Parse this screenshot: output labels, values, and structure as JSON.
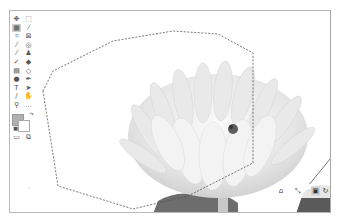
{
  "app": {
    "title": "Image editor canvas"
  },
  "toolbar": {
    "tools": [
      {
        "name": "move-tool",
        "glyph": "✥",
        "col": 0,
        "row": 0
      },
      {
        "name": "rect-marquee-tool",
        "glyph": "⬚",
        "col": 1,
        "row": 0
      },
      {
        "name": "object-select-tool",
        "glyph": "▦",
        "col": 0,
        "row": 1,
        "active": true
      },
      {
        "name": "magic-wand-tool",
        "glyph": "⁄",
        "col": 1,
        "row": 1
      },
      {
        "name": "crop-tool",
        "glyph": "⌗",
        "col": 0,
        "row": 2
      },
      {
        "name": "frame-tool",
        "glyph": "⊠",
        "col": 1,
        "row": 2
      },
      {
        "name": "eyedropper-tool",
        "glyph": "⁄",
        "col": 0,
        "row": 3
      },
      {
        "name": "spot-heal-tool",
        "glyph": "◎",
        "col": 1,
        "row": 3
      },
      {
        "name": "brush-tool",
        "glyph": "⁄",
        "col": 0,
        "row": 4
      },
      {
        "name": "stamp-tool",
        "glyph": "♟",
        "col": 1,
        "row": 4
      },
      {
        "name": "history-brush-tool",
        "glyph": "✓",
        "col": 0,
        "row": 5
      },
      {
        "name": "eraser-tool",
        "glyph": "◆",
        "col": 1,
        "row": 5
      },
      {
        "name": "gradient-tool",
        "glyph": "▤",
        "col": 0,
        "row": 6
      },
      {
        "name": "blur-tool",
        "glyph": "◇",
        "col": 1,
        "row": 6
      },
      {
        "name": "dodge-tool",
        "glyph": "●",
        "col": 0,
        "row": 7
      },
      {
        "name": "pen-tool",
        "glyph": "✒",
        "col": 1,
        "row": 7
      },
      {
        "name": "type-tool",
        "glyph": "T",
        "col": 0,
        "row": 8
      },
      {
        "name": "path-select-tool",
        "glyph": "➤",
        "col": 1,
        "row": 8
      },
      {
        "name": "line-tool",
        "glyph": "∕",
        "col": 0,
        "row": 9
      },
      {
        "name": "hand-tool",
        "glyph": "✋",
        "col": 1,
        "row": 9
      },
      {
        "name": "zoom-tool",
        "glyph": "⚲",
        "col": 0,
        "row": 10
      },
      {
        "name": "more-tools",
        "glyph": "…",
        "col": 1,
        "row": 10
      }
    ],
    "bottom": [
      {
        "name": "quick-mask-button",
        "glyph": "▭",
        "col": 0
      },
      {
        "name": "screen-mode-button",
        "glyph": "⧉",
        "col": 1
      }
    ],
    "colors": {
      "foreground": "#b0b0b0",
      "background": "#ffffff"
    }
  },
  "canvas": {
    "selection": "polygonal lasso (marching ants)",
    "image": "white chrysanthemum flower, grayscale"
  },
  "nav_panel": {
    "home": "⌂",
    "transform": "⤡",
    "separator": "·",
    "buttons": [
      {
        "name": "select-mode-rect",
        "glyph": "▣",
        "selected": true
      },
      {
        "name": "select-mode-lasso",
        "glyph": "↻",
        "selected": false
      },
      {
        "name": "select-mode-poly",
        "glyph": "◩",
        "selected": false
      },
      {
        "name": "select-mode-auto",
        "glyph": "▪",
        "selected": false
      }
    ]
  },
  "colors": {
    "frame_border": "#b8b8b8",
    "active_tool_bg": "#cfcfcf",
    "selected_mode_bg": "#d6d6d6"
  }
}
